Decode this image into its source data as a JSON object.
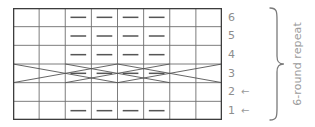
{
  "chart_data": {
    "type": "table",
    "title": "",
    "columns": 8,
    "rows": 6,
    "symbol_legend": {
      "dash": "purl stitch",
      "blank": "knit stitch",
      "cross": "traveling / cable crossing"
    },
    "row_order_top_to_bottom": [
      6,
      5,
      4,
      3,
      2,
      1
    ],
    "cells": [
      {
        "row": 6,
        "symbols": [
          "blank",
          "blank",
          "dash",
          "dash",
          "dash",
          "dash",
          "blank",
          "blank"
        ]
      },
      {
        "row": 5,
        "symbols": [
          "blank",
          "blank",
          "dash",
          "dash",
          "dash",
          "dash",
          "blank",
          "blank"
        ]
      },
      {
        "row": 4,
        "symbols": [
          "blank",
          "blank",
          "dash",
          "dash",
          "dash",
          "dash",
          "blank",
          "blank"
        ]
      },
      {
        "row": 3,
        "symbols": [
          "cross",
          "cross",
          "dash",
          "dash",
          "dash",
          "dash",
          "cross",
          "cross"
        ]
      },
      {
        "row": 2,
        "symbols": [
          "blank",
          "blank",
          "blank",
          "blank",
          "blank",
          "blank",
          "blank",
          "blank"
        ]
      },
      {
        "row": 1,
        "symbols": [
          "blank",
          "blank",
          "dash",
          "dash",
          "dash",
          "dash",
          "blank",
          "blank"
        ]
      }
    ]
  },
  "grid": {
    "columns": 8,
    "rows": 6,
    "line_color": "#6e6e6e",
    "border_color": "#3d3d3d",
    "symbol_color": "#555555"
  },
  "row_labels": [
    {
      "number": "6",
      "arrow": ""
    },
    {
      "number": "5",
      "arrow": ""
    },
    {
      "number": "4",
      "arrow": ""
    },
    {
      "number": "3",
      "arrow": ""
    },
    {
      "number": "2",
      "arrow": "←"
    },
    {
      "number": "1",
      "arrow": "←"
    }
  ],
  "repeat": {
    "caption": "6-round repeat",
    "bracket_color": "#7a7a7a",
    "text_color": "#9b9b9b"
  }
}
